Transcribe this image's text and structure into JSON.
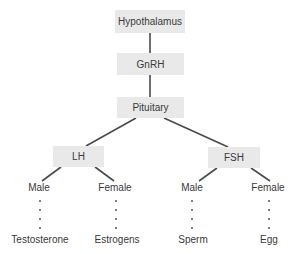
{
  "diagram": {
    "colors": {
      "box_fill": "#e9e9e9",
      "line": "#4a4a4a",
      "text": "#3a3a3a"
    },
    "nodes": {
      "hypothalamus": "Hypothalamus",
      "gnrh": "GnRH",
      "pituitary": "Pituitary",
      "lh": "LH",
      "fsh": "FSH"
    },
    "branches": {
      "lh_male": "Male",
      "lh_female": "Female",
      "fsh_male": "Male",
      "fsh_female": "Female"
    },
    "outcomes": {
      "lh_male": "Testosterone",
      "lh_female": "Estrogens",
      "fsh_male": "Sperm",
      "fsh_female": "Egg"
    }
  }
}
